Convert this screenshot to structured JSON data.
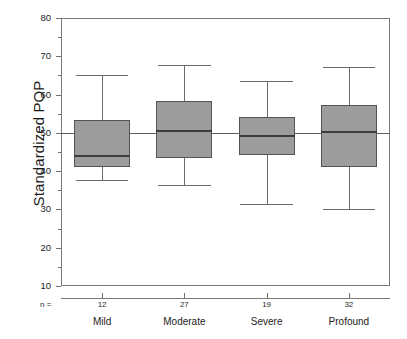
{
  "chart_data": {
    "type": "box",
    "title": "",
    "xlabel": "",
    "ylabel": "Standardized POP",
    "ylim": [
      10,
      80
    ],
    "ytick_values": [
      10,
      20,
      30,
      40,
      50,
      60,
      70,
      80
    ],
    "ytick_labels": [
      "10",
      "20",
      "30",
      "40",
      "50",
      "60",
      "70",
      "80"
    ],
    "yminor_values": [
      15,
      25,
      35,
      45,
      55,
      65,
      75
    ],
    "grid": false,
    "legend": null,
    "reference_line": {
      "value": 50,
      "label": ""
    },
    "n_prefix_label": "n =",
    "categories": [
      "Mild",
      "Moderate",
      "Severe",
      "Profound"
    ],
    "counts": [
      "12",
      "27",
      "19",
      "32"
    ],
    "boxes": [
      {
        "category": "Mild",
        "n": 12,
        "whisker_low": 37.8,
        "q1": 41.0,
        "median": 43.9,
        "q3": 53.3,
        "whisker_high": 65.1
      },
      {
        "category": "Moderate",
        "n": 27,
        "whisker_low": 36.3,
        "q1": 43.4,
        "median": 50.6,
        "q3": 58.2,
        "whisker_high": 67.8
      },
      {
        "category": "Severe",
        "n": 19,
        "whisker_low": 31.5,
        "q1": 44.1,
        "median": 49.2,
        "q3": 54.1,
        "whisker_high": 63.6
      },
      {
        "category": "Profound",
        "n": 32,
        "whisker_low": 30.1,
        "q1": 41.1,
        "median": 50.3,
        "q3": 57.4,
        "whisker_high": 67.1
      }
    ],
    "colors": {
      "box_fill": "#9c9c9c",
      "box_edge": "#545454",
      "median_line": "#3d3d3d",
      "whisker": "#6b6b6b",
      "axis": "#7a7a7a",
      "reference_line": "#5d5d5d",
      "text": "#1c1c1c",
      "background": "#ffffff"
    }
  }
}
